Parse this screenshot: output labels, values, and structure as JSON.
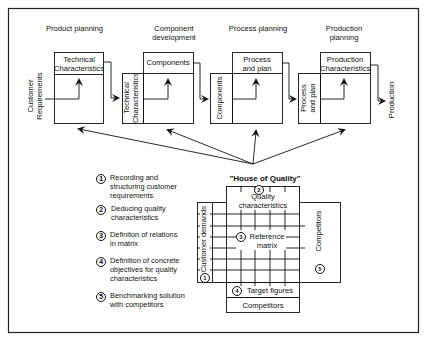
{
  "stages": [
    {
      "title": "Product planning",
      "top_box": "Technical Characteristics",
      "left_label": "Customer Requirements"
    },
    {
      "title": "Component development",
      "top_box": "Components",
      "left_label": "Technical Characteristics"
    },
    {
      "title": "Process planning",
      "top_box": "Process and plan",
      "left_label": "Components"
    },
    {
      "title": "Production planning",
      "top_box": "Production Characteristics",
      "left_label": "Process and plan"
    }
  ],
  "output_label": "Production",
  "house_of_quality": {
    "title": "\"House of Quality\"",
    "quality_characteristics": "Quality characteristics",
    "customer_demands": "Customer demands",
    "reference_matrix": "Reference matrix",
    "competitors_side": "Competitors",
    "target_figures": "Target figures",
    "competitors_bottom": "Competitors",
    "markers": {
      "customer_demands": "1",
      "quality_characteristics": "2",
      "reference_matrix": "3",
      "target_figures": "4",
      "competitors_side": "5"
    }
  },
  "steps": [
    {
      "num": "1",
      "text": "Recording and structuring customer requirements"
    },
    {
      "num": "2",
      "text": "Deducing quality characteristics"
    },
    {
      "num": "3",
      "text": "Definiton of relations in  matrix"
    },
    {
      "num": "4",
      "text": "Definition of concrete objectives for quality characteristics"
    },
    {
      "num": "5",
      "text": "Benchmarking solution with competitors"
    }
  ]
}
